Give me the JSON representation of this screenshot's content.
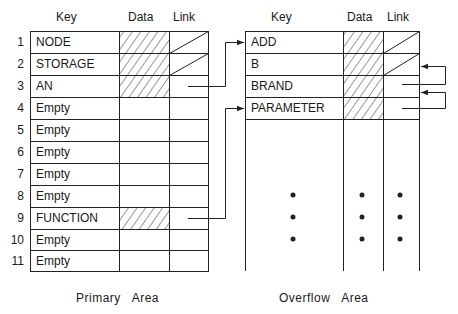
{
  "primary": {
    "caption": "Primary   Area",
    "headers": {
      "key": "Key",
      "data": "Data",
      "link": "Link"
    },
    "rows": [
      {
        "num": "1",
        "key": "NODE",
        "data_filled": true,
        "link": "diagonal"
      },
      {
        "num": "2",
        "key": "STORAGE",
        "data_filled": true,
        "link": "diagonal"
      },
      {
        "num": "3",
        "key": "AN",
        "data_filled": true,
        "link": "pointer-to-ADD"
      },
      {
        "num": "4",
        "key": "Empty",
        "data_filled": false,
        "link": ""
      },
      {
        "num": "5",
        "key": "Empty",
        "data_filled": false,
        "link": ""
      },
      {
        "num": "6",
        "key": "Empty",
        "data_filled": false,
        "link": ""
      },
      {
        "num": "7",
        "key": "Empty",
        "data_filled": false,
        "link": ""
      },
      {
        "num": "8",
        "key": "Empty",
        "data_filled": false,
        "link": ""
      },
      {
        "num": "9",
        "key": "FUNCTION",
        "data_filled": true,
        "link": "pointer-to-PARAMETER"
      },
      {
        "num": "10",
        "key": "Empty",
        "data_filled": false,
        "link": ""
      },
      {
        "num": "11",
        "key": "Empty",
        "data_filled": false,
        "link": ""
      }
    ]
  },
  "overflow": {
    "caption": "Overflow   Area",
    "headers": {
      "key": "Key",
      "data": "Data",
      "link": "Link"
    },
    "rows": [
      {
        "key": "ADD",
        "data_filled": true,
        "link": "diagonal"
      },
      {
        "key": "B",
        "data_filled": true,
        "link": "diagonal"
      },
      {
        "key": "BRAND",
        "data_filled": true,
        "link": "pointer-to-B"
      },
      {
        "key": "PARAMETER",
        "data_filled": true,
        "link": "pointer-to-BRAND"
      }
    ],
    "ellipsis": "• • •"
  },
  "colors": {
    "line": "#222222",
    "hatch": "#333333",
    "background": "#ffffff"
  }
}
